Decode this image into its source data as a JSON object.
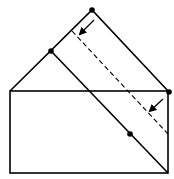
{
  "diagram": {
    "stroke_color": "#000000",
    "background": "#ffffff",
    "rectangle": {
      "x1": 10,
      "y1": 91,
      "x2": 168,
      "y2": 173
    },
    "triangle": {
      "left": [
        10,
        91
      ],
      "apex": [
        92,
        10
      ],
      "right": [
        169,
        92
      ]
    },
    "solid_fold_line": {
      "from": [
        51,
        51
      ],
      "to": [
        168,
        173
      ]
    },
    "dashed_fold_line": {
      "from": [
        72,
        31
      ],
      "to": [
        168,
        134
      ]
    },
    "dots": [
      {
        "name": "apex-dot",
        "cx": 92,
        "cy": 10
      },
      {
        "name": "left-edge-dot",
        "cx": 51,
        "cy": 51
      },
      {
        "name": "right-corner-dot",
        "cx": 169,
        "cy": 92
      },
      {
        "name": "diagonal-dot",
        "cx": 130,
        "cy": 134
      }
    ],
    "arrows": [
      {
        "name": "upper-fold-arrow",
        "from": [
          94,
          20
        ],
        "to": [
          80,
          34
        ]
      },
      {
        "name": "lower-fold-arrow",
        "from": [
          163,
          99
        ],
        "to": [
          150,
          111
        ]
      }
    ]
  }
}
